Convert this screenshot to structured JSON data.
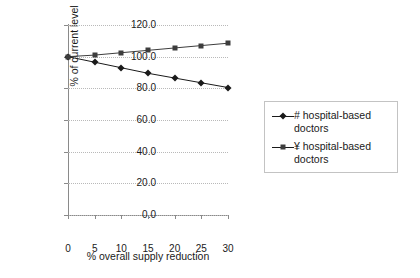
{
  "chart_data": {
    "type": "line",
    "title": "",
    "xlabel": "% overall supply reduction",
    "ylabel": "% of current level",
    "x": [
      0,
      5,
      10,
      15,
      20,
      25,
      30
    ],
    "xlim": [
      0,
      30
    ],
    "ylim": [
      0,
      120
    ],
    "ytick_labels": [
      "0.0",
      "20.0",
      "40.0",
      "60.0",
      "80.0",
      "100.0",
      "120.0"
    ],
    "yticks": [
      0,
      20,
      40,
      60,
      80,
      100,
      120
    ],
    "xtick_labels": [
      "0",
      "5",
      "10",
      "15",
      "20",
      "25",
      "30"
    ],
    "grid": "horizontal-dotted",
    "legend_position": "right",
    "series": [
      {
        "name": "# hospital-based doctors",
        "marker": "diamond",
        "color": "#1a1a1a",
        "values": [
          100.0,
          96.5,
          93.0,
          89.5,
          86.5,
          83.5,
          80.5
        ]
      },
      {
        "name": "¥ hospital-based doctors",
        "marker": "square",
        "color": "#3d3d3d",
        "values": [
          100.0,
          101.0,
          102.5,
          104.0,
          105.5,
          107.0,
          108.5
        ]
      }
    ]
  },
  "legend": {
    "entries": [
      {
        "label": "# hospital-based doctors"
      },
      {
        "label": "¥ hospital-based doctors"
      }
    ]
  }
}
